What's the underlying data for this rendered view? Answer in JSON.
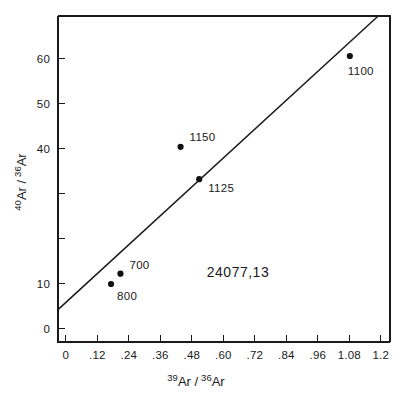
{
  "figure": {
    "sample_id": "24077,13",
    "background": "#ffffff",
    "ink_color": "#1a1a1a"
  },
  "chart_data": {
    "type": "scatter",
    "title": "",
    "subtitle": "",
    "annotation": "24077,13",
    "xlabel_parts": {
      "sup1": "39",
      "base1": "Ar /",
      "sup2": "36",
      "base2": "Ar"
    },
    "ylabel_parts": {
      "sup1": "40",
      "base1": "Ar /",
      "sup2": "36",
      "base2": "Ar"
    },
    "xlabel": "39Ar / 36Ar",
    "ylabel": "40Ar / 36Ar",
    "xlim": [
      -0.03,
      1.235
    ],
    "ylim": [
      -3.0,
      69.5
    ],
    "grid": false,
    "legend": "none",
    "x_ticks": [
      0,
      0.12,
      0.24,
      0.36,
      0.48,
      0.6,
      0.72,
      0.84,
      0.96,
      1.08,
      1.2
    ],
    "x_tick_labels": [
      "0",
      ".12",
      ".24",
      ".36",
      ".48",
      ".60",
      ".72",
      ".84",
      ".96",
      "1.08",
      "1.2"
    ],
    "y_ticks": [
      0,
      10,
      20,
      30,
      40,
      50,
      60
    ],
    "y_tick_labels": [
      "0",
      "10",
      "",
      "",
      "40",
      "50",
      "60"
    ],
    "points": [
      {
        "label": "800",
        "x": 0.172,
        "y": 9.9,
        "label_dx": 6,
        "label_dy": 16
      },
      {
        "label": "700",
        "x": 0.208,
        "y": 12.2,
        "label_dx": 9,
        "label_dy": -5
      },
      {
        "label": "1150",
        "x": 0.437,
        "y": 40.4,
        "label_dx": 9,
        "label_dy": -6
      },
      {
        "label": "1125",
        "x": 0.508,
        "y": 33.2,
        "label_dx": 9,
        "label_dy": 13
      },
      {
        "label": "1100",
        "x": 1.082,
        "y": 60.6,
        "label_dx": -2,
        "label_dy": 19
      }
    ],
    "fit_line": {
      "name": "isochron",
      "x_start": -0.03,
      "y_start": 4.2,
      "x_end": 1.19,
      "y_end": 69.5,
      "intercept": 5.8,
      "slope": 53.5
    }
  }
}
